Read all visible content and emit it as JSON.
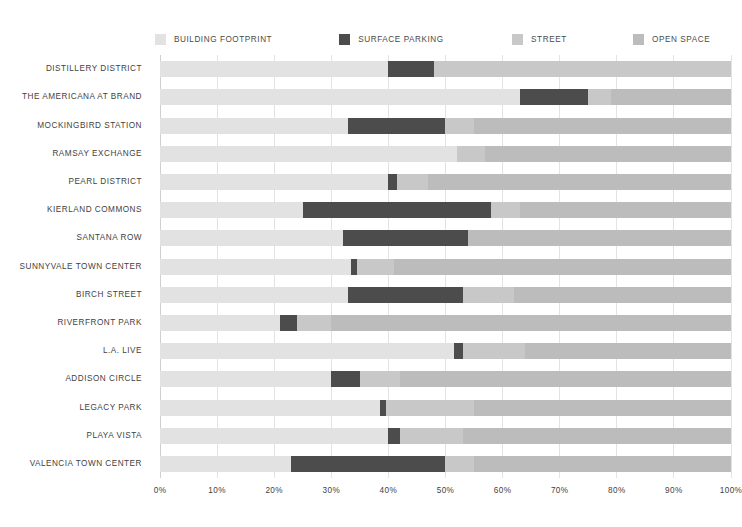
{
  "chart_data": {
    "type": "bar",
    "orientation": "horizontal",
    "stacked": true,
    "normalized": true,
    "title": "",
    "subtitle": "",
    "xlabel": "",
    "ylabel": "",
    "xlim": [
      0,
      100
    ],
    "grid": true,
    "legend_position": "top",
    "xticks": [
      "0%",
      "10%",
      "20%",
      "30%",
      "40%",
      "50%",
      "60%",
      "70%",
      "80%",
      "90%",
      "100%"
    ],
    "xtick_values": [
      0,
      10,
      20,
      30,
      40,
      50,
      60,
      70,
      80,
      90,
      100
    ],
    "series": [
      {
        "name": "BUILDING FOOTPRINT",
        "color": "#e2e2e2",
        "values": [
          40,
          63,
          33,
          52,
          40,
          25,
          32,
          33.5,
          33,
          21,
          51.5,
          30,
          38.5,
          40,
          23
        ]
      },
      {
        "name": "SURFACE PARKING",
        "color": "#4c4c4c",
        "values": [
          8,
          12,
          17,
          0,
          1.5,
          33,
          22,
          1,
          20,
          3,
          1.5,
          5,
          1,
          2,
          27
        ]
      },
      {
        "name": "STREET",
        "color": "#c8c8c8",
        "values": [
          52,
          4,
          5,
          5,
          5.5,
          5,
          0,
          6.5,
          9,
          6,
          11,
          7,
          15.5,
          11,
          5
        ]
      },
      {
        "name": "OPEN SPACE",
        "color": "#bcbcbc",
        "values": [
          0,
          21,
          45,
          43,
          53,
          37,
          46,
          59,
          38,
          70,
          36,
          58,
          45,
          47,
          45
        ]
      }
    ],
    "categories": [
      "DISTILLERY DISTRICT",
      "THE AMERICANA AT BRAND",
      "MOCKINGBIRD STATION",
      "RAMSAY EXCHANGE",
      "PEARL DISTRICT",
      "KIERLAND COMMONS",
      "SANTANA ROW",
      "SUNNYVALE TOWN CENTER",
      "BIRCH STREET",
      "RIVERFRONT PARK",
      "L.A. LIVE",
      "ADDISON CIRCLE",
      "LEGACY PARK",
      "PLAYA VISTA",
      "VALENCIA TOWN CENTER"
    ]
  },
  "legend": {
    "items": [
      {
        "label": "BUILDING FOOTPRINT",
        "color": "#e2e2e2",
        "x_pct": 0
      },
      {
        "label": "SURFACE PARKING",
        "color": "#4c4c4c",
        "x_pct": 32
      },
      {
        "label": "STREET",
        "color": "#c8c8c8",
        "x_pct": 62
      },
      {
        "label": "OPEN SPACE",
        "color": "#bcbcbc",
        "x_pct": 83
      }
    ]
  },
  "colors": {
    "building_footprint": "#e2e2e2",
    "surface_parking": "#4c4c4c",
    "street": "#c8c8c8",
    "open_space": "#bcbcbc",
    "gridline": "#e3e3e3",
    "text": "#3f3f3f",
    "background": "#ffffff"
  }
}
